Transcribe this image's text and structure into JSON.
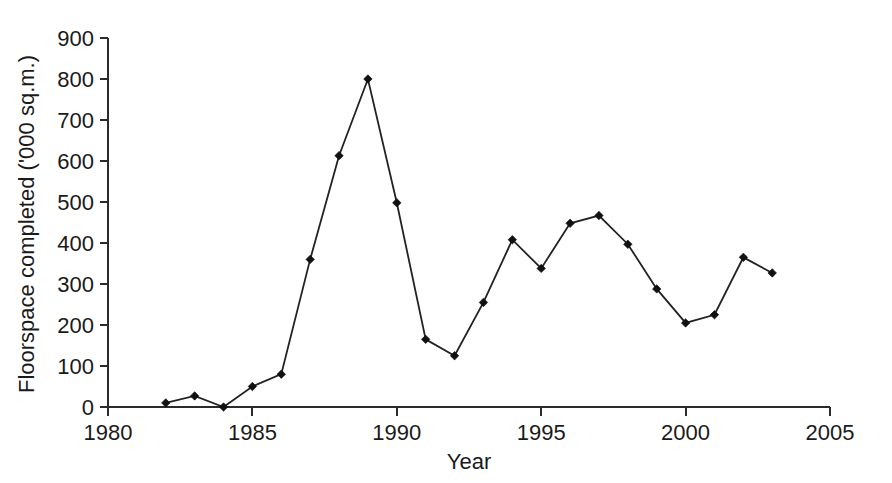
{
  "chart_data": {
    "type": "line",
    "title": "",
    "xlabel": "Year",
    "ylabel": "Floorspace completed ('000 sq.m.)",
    "xlim": [
      1980,
      2005
    ],
    "ylim": [
      0,
      900
    ],
    "xticks": [
      1980,
      1985,
      1990,
      1995,
      2000,
      2005
    ],
    "xtick_labels": [
      "1980",
      "1985",
      "1990",
      "1995",
      "2000",
      "2005"
    ],
    "yticks": [
      0,
      100,
      200,
      300,
      400,
      500,
      600,
      700,
      800,
      900
    ],
    "ytick_labels": [
      "0",
      "100",
      "200",
      "300",
      "400",
      "500",
      "600",
      "700",
      "800",
      "900"
    ],
    "grid": false,
    "legend": false,
    "marker": "diamond",
    "line_color": "#222222",
    "marker_color": "#111111",
    "x": [
      1982,
      1983,
      1984,
      1985,
      1986,
      1987,
      1988,
      1989,
      1990,
      1991,
      1992,
      1993,
      1994,
      1995,
      1996,
      1997,
      1998,
      1999,
      2000,
      2001,
      2002,
      2003
    ],
    "values": [
      10,
      27,
      0,
      50,
      80,
      360,
      613,
      800,
      498,
      165,
      125,
      255,
      408,
      338,
      448,
      467,
      397,
      288,
      205,
      225,
      365,
      327
    ],
    "series": [
      {
        "name": "Floorspace completed",
        "values": [
          10,
          27,
          0,
          50,
          80,
          360,
          613,
          800,
          498,
          165,
          125,
          255,
          408,
          338,
          448,
          467,
          397,
          288,
          205,
          225,
          365,
          327
        ]
      }
    ]
  }
}
